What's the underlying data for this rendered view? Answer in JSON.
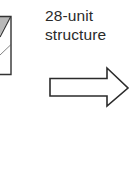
{
  "diagram": {
    "label": {
      "line1": "28-unit",
      "line2": "structure"
    },
    "arrow": {
      "direction": "right",
      "style": "hollow",
      "stroke_color": "#2b2b2b",
      "fill_color": "#ffffff"
    },
    "partial_unit": {
      "stroke_color": "#333333",
      "shade_color": "#b8b8b8"
    }
  }
}
